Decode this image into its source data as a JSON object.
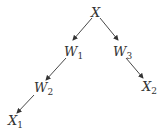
{
  "diagram": {
    "nodes": [
      {
        "id": "X",
        "label": "X",
        "sub": ""
      },
      {
        "id": "W1",
        "label": "W",
        "sub": "1"
      },
      {
        "id": "W3",
        "label": "W",
        "sub": "3"
      },
      {
        "id": "W2",
        "label": "W",
        "sub": "2"
      },
      {
        "id": "X1",
        "label": "X",
        "sub": "1"
      },
      {
        "id": "X2",
        "label": "X",
        "sub": "2"
      }
    ],
    "edges": [
      {
        "from": "X",
        "to": "W1"
      },
      {
        "from": "X",
        "to": "W3"
      },
      {
        "from": "W1",
        "to": "W2"
      },
      {
        "from": "W2",
        "to": "X1"
      },
      {
        "from": "W3",
        "to": "X2"
      }
    ],
    "colors": {
      "stroke": "#333333",
      "background": "#ffffff"
    }
  }
}
